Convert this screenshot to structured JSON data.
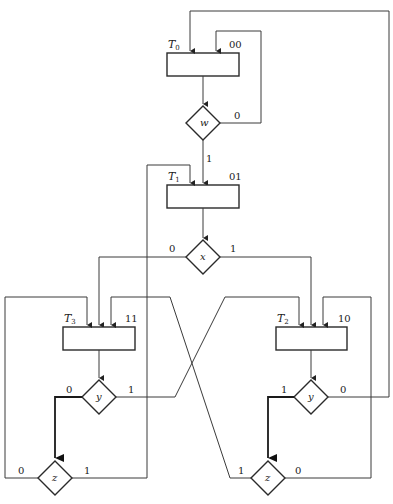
{
  "diagram": {
    "type": "ASM chart",
    "states": [
      {
        "name": "T",
        "sub": "0",
        "code": "00"
      },
      {
        "name": "T",
        "sub": "1",
        "code": "01"
      },
      {
        "name": "T",
        "sub": "2",
        "code": "10"
      },
      {
        "name": "T",
        "sub": "3",
        "code": "11"
      }
    ],
    "decisions": {
      "w": {
        "var": "w",
        "zero": "0",
        "one": "1"
      },
      "x": {
        "var": "x",
        "zero": "0",
        "one": "1"
      },
      "y_left": {
        "var": "y",
        "zero": "0",
        "one": "1"
      },
      "y_right": {
        "var": "y",
        "zero": "0",
        "one": "1"
      },
      "z_left": {
        "var": "z",
        "zero": "0",
        "one": "1"
      },
      "z_right": {
        "var": "z",
        "zero": "0",
        "one": "1"
      }
    }
  }
}
